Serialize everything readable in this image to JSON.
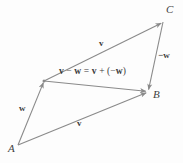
{
  "figure": {
    "background_color": "#fdfdfd",
    "line_color": "#8a8a8a",
    "text_color": "#3b3b3b"
  },
  "points": {
    "A": {
      "label": "A",
      "x": 18,
      "y": 145
    },
    "B": {
      "label": "B",
      "x": 148,
      "y": 92
    },
    "C": {
      "label": "C",
      "x": 163,
      "y": 22
    },
    "M": {
      "label": "",
      "x": 44,
      "y": 81
    }
  },
  "vectors": [
    {
      "name": "v-top",
      "label": "v",
      "from": "M",
      "to": "C",
      "arrowhead": "to"
    },
    {
      "name": "v-bottom",
      "label": "v",
      "from": "A",
      "to": "B",
      "arrowhead": "to"
    },
    {
      "name": "w-left",
      "label": "w",
      "from": "A",
      "to": "M",
      "arrowhead": "to"
    },
    {
      "name": "neg-w",
      "label": "−w",
      "from": "C",
      "to": "B",
      "arrowhead": "to"
    },
    {
      "name": "v-minus-w",
      "label": "v − w = v + (−w)",
      "from": "M",
      "to": "B",
      "arrowhead": "to"
    }
  ],
  "labels": {
    "point_A": "A",
    "point_B": "B",
    "point_C": "C",
    "v_top": "v",
    "v_bottom": "v",
    "w_left": "w",
    "neg_w": "−w",
    "equation_lhs_v": "v",
    "equation_minus": "−",
    "equation_lhs_w": "w",
    "equation_equals": "=",
    "equation_rhs_v": "v",
    "equation_plus": "+",
    "equation_open": "(−",
    "equation_rhs_w": "w",
    "equation_close": ")"
  }
}
